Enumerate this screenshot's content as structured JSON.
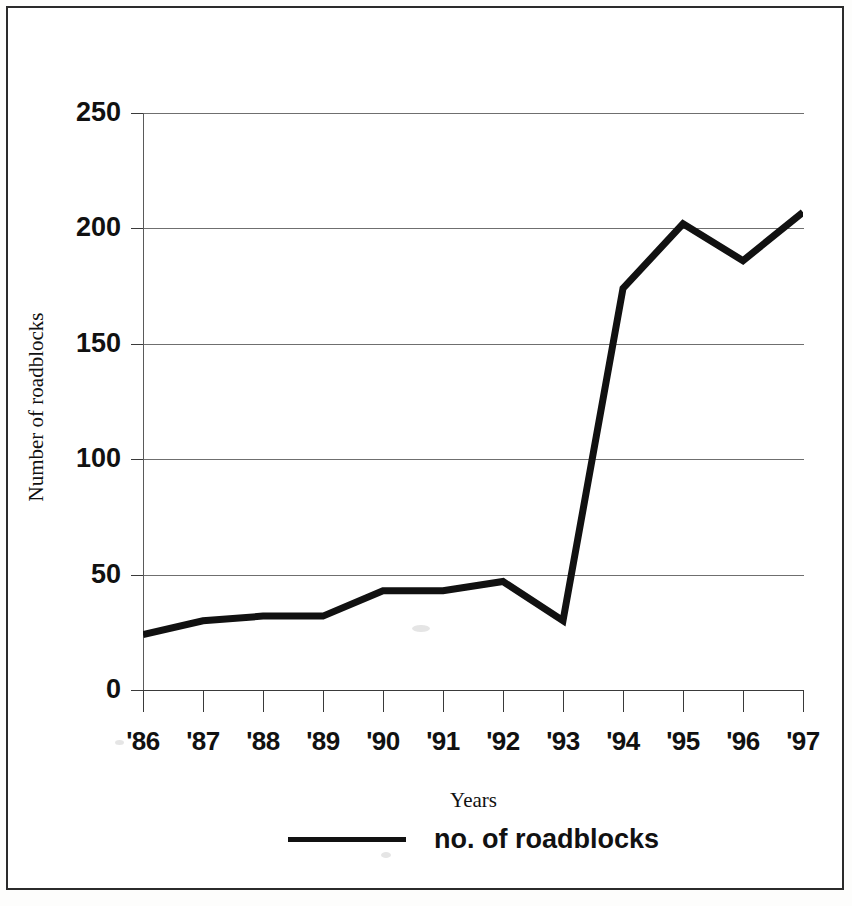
{
  "figure": {
    "border_color": "#2b2b2b",
    "background": "#ffffff"
  },
  "chart_data": {
    "type": "line",
    "title": "",
    "subtitle": "",
    "xlabel": "Years",
    "ylabel": "Number of roadblocks",
    "categories": [
      "'86",
      "'87",
      "'88",
      "'89",
      "'90",
      "'91",
      "'92",
      "'93",
      "'94",
      "'95",
      "'96",
      "'97"
    ],
    "series": [
      {
        "name": "no. of roadblocks",
        "color": "#111111",
        "values": [
          24,
          30,
          32,
          32,
          43,
          43,
          47,
          30,
          174,
          202,
          186,
          207
        ]
      }
    ],
    "ylim": [
      0,
      250
    ],
    "yticks": [
      0,
      50,
      100,
      150,
      200,
      250
    ],
    "ytick_labels": [
      "0",
      "50",
      "100",
      "150",
      "200",
      "250"
    ],
    "grid": "horizontal",
    "legend_position": "bottom",
    "legend_entries": [
      "no. of roadblocks"
    ],
    "line_width": 7,
    "markers": "none",
    "annotations": []
  }
}
